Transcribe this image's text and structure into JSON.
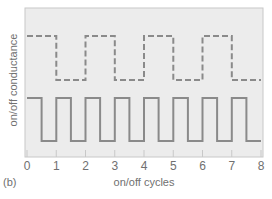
{
  "panel_label": "(b)",
  "colors": {
    "plot_bg": "#ececec",
    "frame": "#c8c8c8",
    "line": "#8a8a8a",
    "text": "#707070"
  },
  "chart_data": {
    "type": "line",
    "title": "",
    "xlabel": "on/off cycles",
    "ylabel": "on/off conductance",
    "xlim": [
      0,
      8
    ],
    "x_ticks": [
      "0",
      "1",
      "2",
      "3",
      "4",
      "5",
      "6",
      "7",
      "8"
    ],
    "grid": false,
    "series": [
      {
        "name": "dashed trace",
        "style": "dashed",
        "period": 2,
        "x": [
          0,
          1,
          1,
          2,
          2,
          3,
          3,
          4,
          4,
          5,
          5,
          6,
          6,
          7,
          7,
          8
        ],
        "values": [
          1,
          1,
          0,
          0,
          1,
          1,
          0,
          0,
          1,
          1,
          0,
          0,
          1,
          1,
          0,
          0
        ]
      },
      {
        "name": "solid trace",
        "style": "solid",
        "period": 1,
        "x": [
          0,
          0.5,
          0.5,
          1,
          1,
          1.5,
          1.5,
          2,
          2,
          2.5,
          2.5,
          3,
          3,
          3.5,
          3.5,
          4,
          4,
          4.5,
          4.5,
          5,
          5,
          5.5,
          5.5,
          6,
          6,
          6.5,
          6.5,
          7,
          7,
          7.5,
          7.5,
          8
        ],
        "values": [
          1,
          1,
          0,
          0,
          1,
          1,
          0,
          0,
          1,
          1,
          0,
          0,
          1,
          1,
          0,
          0,
          1,
          1,
          0,
          0,
          1,
          1,
          0,
          0,
          1,
          1,
          0,
          0,
          1,
          1,
          0,
          0
        ]
      }
    ]
  }
}
